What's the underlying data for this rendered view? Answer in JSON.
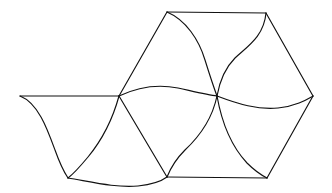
{
  "figure": {
    "title": "",
    "type": "line-drawing",
    "width": 332,
    "height": 193,
    "background_color": "#ffffff",
    "stroke_color": "#111111",
    "stroke_width": 1.15,
    "vertices": [
      {
        "id": "left-outer",
        "name": "left-outer-vertex",
        "x": 20,
        "y": 96
      },
      {
        "id": "top-left",
        "name": "top-left-vertex",
        "x": 167,
        "y": 12
      },
      {
        "id": "top-right",
        "name": "top-right-vertex",
        "x": 266,
        "y": 13
      },
      {
        "id": "right-outer",
        "name": "right-outer-vertex",
        "x": 313,
        "y": 96
      },
      {
        "id": "mid-left",
        "name": "mid-left-vertex",
        "x": 119,
        "y": 96
      },
      {
        "id": "center",
        "name": "center-crossing-vertex",
        "x": 217,
        "y": 96
      },
      {
        "id": "bottom-left",
        "name": "bottom-left-vertex",
        "x": 68,
        "y": 178
      },
      {
        "id": "bottom-center",
        "name": "bottom-center-vertex",
        "x": 167,
        "y": 177
      },
      {
        "id": "bottom-right",
        "name": "bottom-right-vertex",
        "x": 267,
        "y": 178
      }
    ],
    "edges": [
      {
        "id": "e01",
        "name": "edge-left-outer-to-mid-left",
        "from": "left-outer",
        "to": "mid-left",
        "kind": "straight",
        "path": "M 20 96 L 119 96"
      },
      {
        "id": "e02",
        "name": "edge-left-outer-to-bottom-left",
        "from": "left-outer",
        "to": "bottom-left",
        "kind": "curved",
        "path": "M 20 96 C 38 103 47 128 55 150 C 60 164 64 172 68 178"
      },
      {
        "id": "e03",
        "name": "edge-top-left-to-top-right",
        "from": "top-left",
        "to": "top-right",
        "kind": "straight",
        "path": "M 167 12 L 266 13"
      },
      {
        "id": "e04",
        "name": "edge-top-left-to-mid-left",
        "from": "top-left",
        "to": "mid-left",
        "kind": "straight",
        "path": "M 167 12 L 119 96"
      },
      {
        "id": "e05",
        "name": "edge-top-left-to-center",
        "from": "top-left",
        "to": "center",
        "kind": "curved",
        "path": "M 167 12 C 186 20 199 40 205 60 C 210 76 214 88 217 96"
      },
      {
        "id": "e06",
        "name": "edge-top-right-to-right-outer",
        "from": "top-right",
        "to": "right-outer",
        "kind": "straight",
        "path": "M 266 13 L 313 96"
      },
      {
        "id": "e07",
        "name": "edge-top-right-to-center",
        "from": "top-right",
        "to": "center",
        "kind": "curved",
        "path": "M 266 13 C 264 36 248 46 235 58 C 224 69 219 85 217 96"
      },
      {
        "id": "e08",
        "name": "edge-mid-left-to-center",
        "from": "mid-left",
        "to": "center",
        "kind": "curved",
        "path": "M 119 96 C 140 86 158 84 178 88 C 196 92 208 95 217 96"
      },
      {
        "id": "e09",
        "name": "edge-center-to-right-outer",
        "from": "center",
        "to": "right-outer",
        "kind": "curved",
        "path": "M 217 96 C 238 104 258 110 278 108 C 296 106 306 100 313 96"
      },
      {
        "id": "e10",
        "name": "edge-mid-left-to-bottom-left",
        "from": "mid-left",
        "to": "bottom-left",
        "kind": "curved",
        "path": "M 119 96 C 113 118 102 140 88 157 C 78 169 72 175 68 178"
      },
      {
        "id": "e11",
        "name": "edge-mid-left-to-bottom-center",
        "from": "mid-left",
        "to": "bottom-center",
        "kind": "straight",
        "path": "M 119 96 L 167 177"
      },
      {
        "id": "e12",
        "name": "edge-center-to-bottom-center",
        "from": "center",
        "to": "bottom-center",
        "kind": "curved",
        "path": "M 217 96 C 212 120 200 136 185 150 C 174 161 169 172 167 177"
      },
      {
        "id": "e13",
        "name": "edge-center-to-bottom-right",
        "from": "center",
        "to": "bottom-right",
        "kind": "curved",
        "path": "M 217 96 C 222 124 233 148 247 163 C 257 173 263 176 267 178"
      },
      {
        "id": "e14",
        "name": "edge-bottom-left-to-bottom-center",
        "from": "bottom-left",
        "to": "bottom-center",
        "kind": "curved",
        "path": "M 68 178 C 92 182 116 188 138 186 C 156 184 163 180 167 177"
      },
      {
        "id": "e15",
        "name": "edge-bottom-center-to-bottom-right",
        "from": "bottom-center",
        "to": "bottom-right",
        "kind": "straight",
        "path": "M 167 177 L 267 178"
      },
      {
        "id": "e16",
        "name": "edge-bottom-right-to-right-outer",
        "from": "bottom-right",
        "to": "right-outer",
        "kind": "straight",
        "path": "M 267 178 L 313 96"
      }
    ]
  }
}
